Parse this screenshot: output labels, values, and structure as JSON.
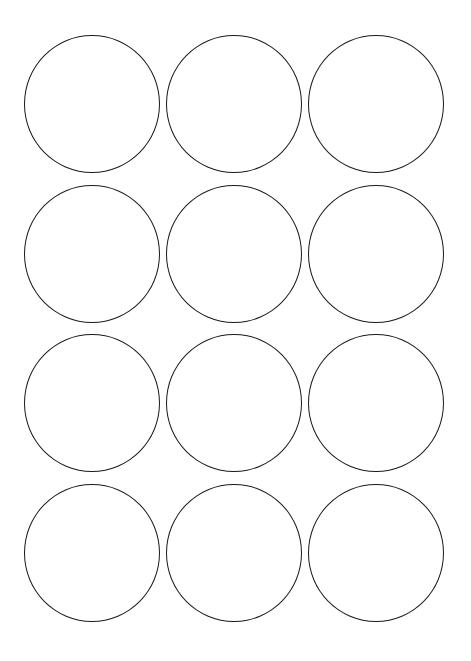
{
  "page": {
    "type": "label-sheet",
    "shape": "circle",
    "columns": 3,
    "rows": 4,
    "stroke_color": "#1a1a1a",
    "background_color": "#ffffff"
  },
  "labels": [
    {
      "row": 1,
      "col": 1,
      "cx": 92,
      "cy": 104
    },
    {
      "row": 1,
      "col": 2,
      "cx": 234,
      "cy": 104
    },
    {
      "row": 1,
      "col": 3,
      "cx": 376,
      "cy": 104
    },
    {
      "row": 2,
      "col": 1,
      "cx": 92,
      "cy": 254
    },
    {
      "row": 2,
      "col": 2,
      "cx": 234,
      "cy": 254
    },
    {
      "row": 2,
      "col": 3,
      "cx": 376,
      "cy": 254
    },
    {
      "row": 3,
      "col": 1,
      "cx": 92,
      "cy": 403
    },
    {
      "row": 3,
      "col": 2,
      "cx": 234,
      "cy": 403
    },
    {
      "row": 3,
      "col": 3,
      "cx": 376,
      "cy": 403
    },
    {
      "row": 4,
      "col": 1,
      "cx": 92,
      "cy": 553
    },
    {
      "row": 4,
      "col": 2,
      "cx": 234,
      "cy": 553
    },
    {
      "row": 4,
      "col": 3,
      "cx": 376,
      "cy": 553
    }
  ]
}
